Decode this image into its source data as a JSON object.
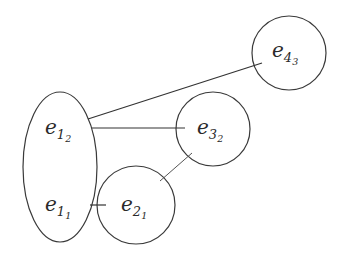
{
  "diagram": {
    "nodes": [
      {
        "id": "e1_2",
        "base": "e",
        "sub": "1",
        "subsub": "2",
        "group": "ellipse-left"
      },
      {
        "id": "e1_1",
        "base": "e",
        "sub": "1",
        "subsub": "1",
        "group": "ellipse-left"
      },
      {
        "id": "e2_1",
        "base": "e",
        "sub": "2",
        "subsub": "1",
        "group": "circle-e2"
      },
      {
        "id": "e3_2",
        "base": "e",
        "sub": "3",
        "subsub": "2",
        "group": "circle-e3"
      },
      {
        "id": "e4_3",
        "base": "e",
        "sub": "4",
        "subsub": "3",
        "group": "circle-e4"
      }
    ],
    "edges": [
      {
        "from": "e1_2",
        "to": "e4_3"
      },
      {
        "from": "e1_2",
        "to": "e3_2"
      },
      {
        "from": "e1_1",
        "to": "e2_1"
      },
      {
        "from": "e2_1",
        "to": "e3_2"
      }
    ],
    "colors": {
      "stroke": "#3a3a3a",
      "text": "#2a2a2a",
      "background": "#ffffff"
    }
  }
}
